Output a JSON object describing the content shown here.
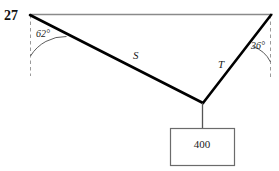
{
  "figure": {
    "problem_number": "27",
    "angles": [
      {
        "name": "left-angle",
        "value": "62°"
      },
      {
        "name": "right-angle",
        "value": "36°"
      }
    ],
    "members": [
      {
        "name": "left-cable",
        "label": "S"
      },
      {
        "name": "right-cable",
        "label": "T"
      }
    ],
    "load": {
      "label": "400"
    },
    "colors": {
      "cable": "#000000",
      "ceiling": "#8a8a8a",
      "dashed": "#9a9a9a",
      "box_stroke": "#6b6b6b",
      "text": "#1a1a1a"
    },
    "geometry": {
      "left_anchor": [
        30,
        15
      ],
      "right_anchor": [
        271,
        15
      ],
      "knot": [
        203,
        103
      ],
      "box": [
        170,
        128,
        64,
        37
      ]
    }
  }
}
